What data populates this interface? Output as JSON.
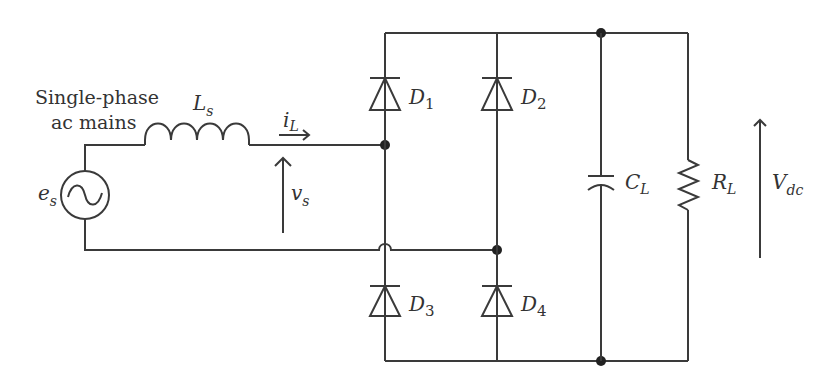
{
  "diagram": {
    "source": {
      "label_line1": "Single-phase",
      "label_line2": "ac mains",
      "symbol": "e",
      "sub": "s"
    },
    "inductor": {
      "symbol": "L",
      "sub": "s"
    },
    "current": {
      "symbol": "i",
      "sub": "L"
    },
    "voltage_in": {
      "symbol": "v",
      "sub": "s"
    },
    "diodes": [
      {
        "symbol": "D",
        "sub": "1"
      },
      {
        "symbol": "D",
        "sub": "2"
      },
      {
        "symbol": "D",
        "sub": "3"
      },
      {
        "symbol": "D",
        "sub": "4"
      }
    ],
    "capacitor": {
      "symbol": "C",
      "sub": "L"
    },
    "resistor": {
      "symbol": "R",
      "sub": "L"
    },
    "voltage_out": {
      "symbol": "V",
      "sub": "dc"
    },
    "colors": {
      "wire": "#3a3a3a",
      "text": "#333333",
      "background": "#ffffff"
    }
  }
}
